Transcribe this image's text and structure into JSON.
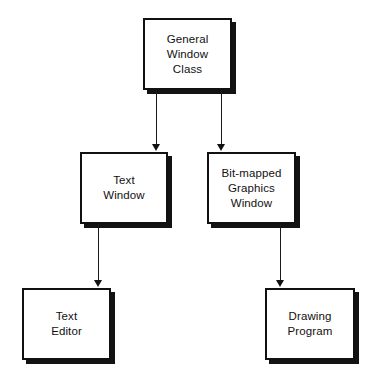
{
  "diagram": {
    "type": "hierarchy-tree",
    "background_color": "#ffffff",
    "box_fill_color": "#ffffff",
    "box_border_color": "#111111",
    "shadow_color": "#131313",
    "arrow_color": "#1a1a1a",
    "nodes": [
      {
        "id": "general-window-class",
        "label": "General\nWindow\nClass",
        "x": 143,
        "y": 18,
        "width": 89,
        "height": 72
      },
      {
        "id": "text-window",
        "label": "Text\nWindow",
        "x": 80,
        "y": 152,
        "width": 88,
        "height": 72
      },
      {
        "id": "bit-mapped-graphics-window",
        "label": "Bit-mapped\nGraphics\nWindow",
        "x": 207,
        "y": 152,
        "width": 89,
        "height": 72
      },
      {
        "id": "text-editor",
        "label": "Text\nEditor",
        "x": 22,
        "y": 288,
        "width": 89,
        "height": 72
      },
      {
        "id": "drawing-program",
        "label": "Drawing\nProgram",
        "x": 265,
        "y": 288,
        "width": 90,
        "height": 72
      }
    ],
    "edges": [
      {
        "id": "edge-general-to-text-window",
        "from": "general-window-class",
        "to": "text-window",
        "x": 156,
        "y_start": 90,
        "y_end": 151
      },
      {
        "id": "edge-general-to-graphics-window",
        "from": "general-window-class",
        "to": "bit-mapped-graphics-window",
        "x": 221,
        "y_start": 90,
        "y_end": 151
      },
      {
        "id": "edge-text-window-to-text-editor",
        "from": "text-window",
        "to": "text-editor",
        "x": 98,
        "y_start": 224,
        "y_end": 287
      },
      {
        "id": "edge-graphics-window-to-drawing-program",
        "from": "bit-mapped-graphics-window",
        "to": "drawing-program",
        "x": 280,
        "y_start": 224,
        "y_end": 287
      }
    ]
  }
}
